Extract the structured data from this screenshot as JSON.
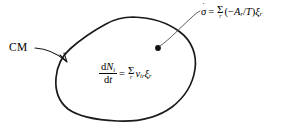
{
  "figure": {
    "name": "closed-system-entropy-production-diagram",
    "background_color": "#ffffff",
    "stroke_color": "#1a1a1a",
    "text_color": "#000000"
  },
  "labels": {
    "cm": "CM"
  },
  "equations": {
    "entropy_production": {
      "lhs_symbol": "σ",
      "lhs_accent": "˙",
      "equals": "=",
      "sum_symbol": "Σ",
      "sum_index": "r",
      "open_paren": "(",
      "minus": "−",
      "affinity_symbol": "A",
      "affinity_subscript": "r",
      "slash": "/",
      "temperature_symbol": "T",
      "close_paren": ")",
      "rate_symbol": "ξ",
      "rate_subscript": "r",
      "plain_text": "σ̇ = Σ_r(−A_r/T)ξ_r"
    },
    "mole_balance": {
      "numerator_d": "d",
      "numerator_symbol": "N",
      "numerator_subscript": "i",
      "denominator_d": "d",
      "denominator_symbol": "t",
      "equals": "=",
      "sum_symbol": "Σ",
      "sum_index": "r",
      "nu_symbol": "ν",
      "nu_subscript": "ir",
      "rate_symbol": "ξ",
      "rate_subscript": "r",
      "plain_text": "dN_i/dt = Σ_r ν_ir ξ_r"
    }
  },
  "graphics": {
    "blob_name": "control-mass-boundary",
    "center_dot_name": "interior-point-marker",
    "cm_leader_name": "cm-leader-line-with-arrowhead",
    "entropy_leader_name": "entropy-leader-line"
  }
}
